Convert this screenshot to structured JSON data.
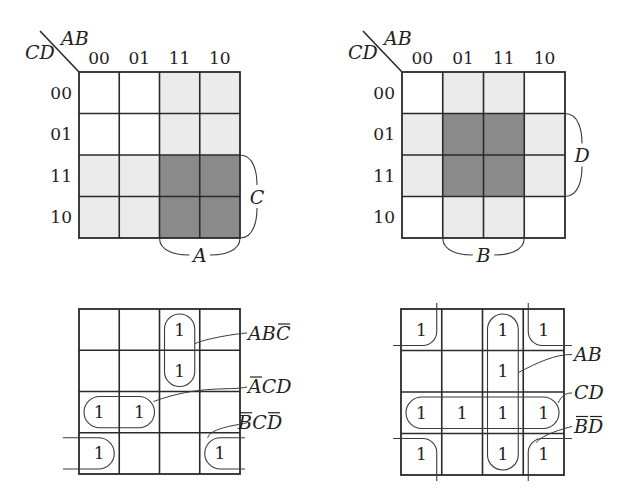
{
  "figure": {
    "maps": [
      {
        "id": "map-A-C",
        "corner_col_var": "AB",
        "corner_row_var": "CD",
        "col_headers": [
          "00",
          "01",
          "11",
          "10"
        ],
        "row_headers": [
          "00",
          "01",
          "11",
          "10"
        ],
        "shading": [
          [
            "none",
            "none",
            "light",
            "light"
          ],
          [
            "none",
            "none",
            "light",
            "light"
          ],
          [
            "light",
            "light",
            "dark",
            "dark"
          ],
          [
            "light",
            "light",
            "dark",
            "dark"
          ]
        ],
        "brace_labels": [
          {
            "text": "A",
            "side": "bottom",
            "span": "columns 11,10"
          },
          {
            "text": "C",
            "side": "right",
            "span": "rows 11,10"
          }
        ]
      },
      {
        "id": "map-B-D",
        "corner_col_var": "AB",
        "corner_row_var": "CD",
        "col_headers": [
          "00",
          "01",
          "11",
          "10"
        ],
        "row_headers": [
          "00",
          "01",
          "11",
          "10"
        ],
        "shading": [
          [
            "none",
            "light",
            "light",
            "none"
          ],
          [
            "light",
            "dark",
            "dark",
            "light"
          ],
          [
            "light",
            "dark",
            "dark",
            "light"
          ],
          [
            "none",
            "light",
            "light",
            "none"
          ]
        ],
        "brace_labels": [
          {
            "text": "B",
            "side": "bottom",
            "span": "columns 01,11"
          },
          {
            "text": "D",
            "side": "right",
            "span": "rows 01,11"
          }
        ]
      },
      {
        "id": "map-groups-1",
        "cells": [
          [
            "",
            "",
            "1",
            ""
          ],
          [
            "",
            "",
            "1",
            ""
          ],
          [
            "1",
            "1",
            "",
            ""
          ],
          [
            "1",
            "",
            "",
            "1"
          ]
        ],
        "terms": [
          {
            "id": "ABCbar",
            "parts": [
              {
                "t": "A",
                "bar": false
              },
              {
                "t": "B",
                "bar": false
              },
              {
                "t": "C",
                "bar": true
              }
            ]
          },
          {
            "id": "AbarCD",
            "parts": [
              {
                "t": "A",
                "bar": true
              },
              {
                "t": "C",
                "bar": false
              },
              {
                "t": "D",
                "bar": false
              }
            ]
          },
          {
            "id": "BbarCDbar",
            "parts": [
              {
                "t": "B",
                "bar": true
              },
              {
                "t": "C",
                "bar": false
              },
              {
                "t": "D",
                "bar": true
              }
            ]
          }
        ]
      },
      {
        "id": "map-groups-2",
        "cells": [
          [
            "1",
            "",
            "1",
            "1"
          ],
          [
            "",
            "",
            "1",
            ""
          ],
          [
            "1",
            "1",
            "1",
            "1"
          ],
          [
            "1",
            "",
            "1",
            "1"
          ]
        ],
        "terms": [
          {
            "id": "AB",
            "parts": [
              {
                "t": "A",
                "bar": false
              },
              {
                "t": "B",
                "bar": false
              }
            ]
          },
          {
            "id": "CD",
            "parts": [
              {
                "t": "C",
                "bar": false
              },
              {
                "t": "D",
                "bar": false
              }
            ]
          },
          {
            "id": "BbarDbar",
            "parts": [
              {
                "t": "B",
                "bar": true
              },
              {
                "t": "D",
                "bar": true
              }
            ]
          }
        ]
      }
    ],
    "colors": {
      "light_shade": "#ebebeb",
      "dark_shade": "#8a8a8a",
      "line": "#2a2a2a",
      "text": "#222222"
    }
  }
}
